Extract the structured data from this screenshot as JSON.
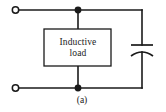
{
  "figure": {
    "caption": "(a)",
    "background_color": "#ffffff",
    "ink_color": "#1a1a1a",
    "width": 166,
    "height": 112
  },
  "circuit": {
    "load_block": {
      "label_line1": "Inductive",
      "label_line2": "load",
      "shape": "rectangle"
    },
    "capacitor": {
      "symbol": "curved-plate-capacitor",
      "plates": 2
    },
    "terminals": [
      {
        "name": "top-left-terminal",
        "symbol": "open-circle"
      },
      {
        "name": "bottom-left-terminal",
        "symbol": "open-circle"
      }
    ],
    "junctions": [
      {
        "name": "top-junction",
        "symbol": "filled-dot"
      },
      {
        "name": "bottom-junction",
        "symbol": "filled-dot"
      }
    ]
  }
}
